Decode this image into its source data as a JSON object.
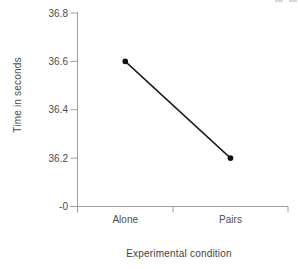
{
  "chart_data": {
    "type": "line",
    "title": "",
    "categories": [
      "Alone",
      "Pairs"
    ],
    "values": [
      36.6,
      36.2
    ],
    "xlabel": "Experimental condition",
    "ylabel": "Time in seconds",
    "y_tick_labels": [
      "36.8",
      "36.6",
      "36.4",
      "36.2",
      "-0"
    ],
    "y_tick_values": [
      36.8,
      36.6,
      36.4,
      36.2,
      0
    ],
    "axis_break_at_zero": true,
    "ylim": [
      36.0,
      36.8
    ],
    "grid": false,
    "legend": "none",
    "colors": {
      "axis": "#9e9e9e",
      "tick_text": "#4c4c4c",
      "line": "#1c1c1c",
      "marker": "#111111",
      "background": "#ffffff"
    }
  }
}
